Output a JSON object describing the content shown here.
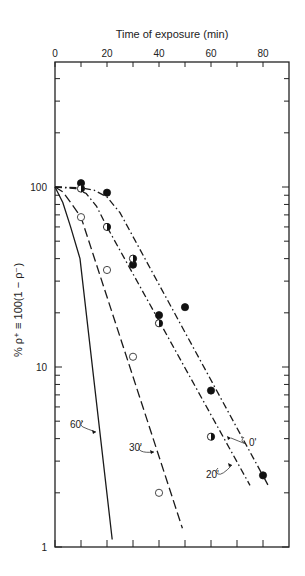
{
  "chart_data": {
    "type": "line",
    "title": "",
    "xlabel": "Time of exposure (min)",
    "ylabel": "% ρ⁺ ≡ 100(1 − ρ⁻)",
    "x_axis_position": "top",
    "xlim": [
      0,
      90
    ],
    "x_ticks": [
      0,
      20,
      40,
      60,
      80
    ],
    "y_scale": "log",
    "ylim": [
      1,
      500
    ],
    "y_ticks": [
      1,
      10,
      100
    ],
    "y_tick_labels": [
      "1",
      "10",
      "100"
    ],
    "grid": false,
    "legend": "inline curve labels",
    "series": [
      {
        "name": "0'",
        "style": "dash-dot",
        "marker": "filled-circle",
        "points": [
          [
            10,
            105
          ],
          [
            20,
            93
          ],
          [
            30,
            37
          ],
          [
            40,
            19.4
          ],
          [
            50,
            21.5
          ],
          [
            60,
            7.4
          ],
          [
            80,
            2.5
          ]
        ],
        "curve": [
          [
            0,
            100
          ],
          [
            10,
            99
          ],
          [
            15,
            96
          ],
          [
            20,
            88
          ],
          [
            25,
            72
          ],
          [
            82,
            2.2
          ]
        ]
      },
      {
        "name": "20'",
        "style": "dash-dot",
        "marker": "half-filled-circle",
        "points": [
          [
            10,
            98
          ],
          [
            20,
            60
          ],
          [
            30,
            40
          ],
          [
            40,
            17.5
          ],
          [
            60,
            4.1
          ]
        ],
        "curve": [
          [
            0,
            100
          ],
          [
            8,
            98
          ],
          [
            12,
            92
          ],
          [
            16,
            78
          ],
          [
            20,
            60
          ],
          [
            75,
            2.2
          ]
        ]
      },
      {
        "name": "30'",
        "style": "dashed",
        "marker": "open-circle",
        "points": [
          [
            10,
            68
          ],
          [
            20,
            34.6
          ],
          [
            30,
            11.4
          ],
          [
            40,
            2.0
          ]
        ],
        "curve": [
          [
            0,
            100
          ],
          [
            3,
            94
          ],
          [
            6,
            82
          ],
          [
            10,
            68
          ],
          [
            49,
            1.27
          ]
        ]
      },
      {
        "name": "60'",
        "style": "solid",
        "marker": "none",
        "points": [],
        "curve": [
          [
            0,
            100
          ],
          [
            3,
            82
          ],
          [
            6,
            60
          ],
          [
            9.6,
            40
          ],
          [
            22,
            1.1
          ]
        ]
      }
    ],
    "annotations": [
      "0'",
      "20'",
      "30'",
      "60'"
    ]
  }
}
